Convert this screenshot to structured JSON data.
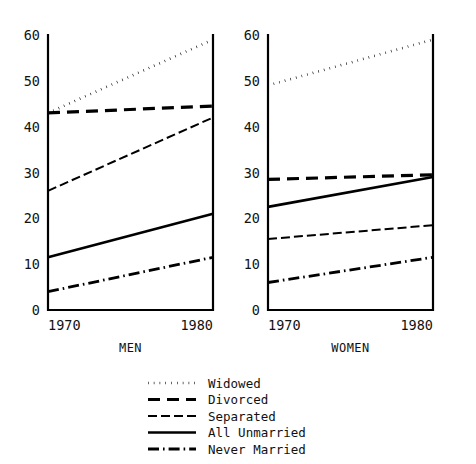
{
  "chart_data": {
    "type": "line",
    "title": "",
    "subtitle": "",
    "xlabel": "",
    "ylabel": "",
    "x": [
      1970,
      1980
    ],
    "xtick_labels": [
      "1970",
      "1980"
    ],
    "ytick_labels": [
      "0",
      "10",
      "20",
      "30",
      "40",
      "50",
      "60"
    ],
    "yticks": [
      0,
      10,
      20,
      30,
      40,
      50,
      60
    ],
    "ylim": [
      0,
      60
    ],
    "xlim": [
      1970,
      1980
    ],
    "grid": false,
    "legend_position": "bottom-center",
    "panels": [
      {
        "label": "MEN",
        "series": [
          {
            "name": "Widowed",
            "style": "dotted",
            "values": [
              43.0,
              59.0
            ]
          },
          {
            "name": "Divorced",
            "style": "dashed",
            "values": [
              43.0,
              44.5
            ]
          },
          {
            "name": "Separated",
            "style": "thin-dash",
            "values": [
              26.0,
              42.0
            ]
          },
          {
            "name": "All Unmarried",
            "style": "solid",
            "values": [
              11.5,
              21.0
            ]
          },
          {
            "name": "Never Married",
            "style": "dash-dot",
            "values": [
              4.0,
              11.5
            ]
          }
        ]
      },
      {
        "label": "WOMEN",
        "series": [
          {
            "name": "Widowed",
            "style": "dotted",
            "values": [
              49.0,
              59.0
            ]
          },
          {
            "name": "Divorced",
            "style": "dashed",
            "values": [
              28.5,
              29.5
            ]
          },
          {
            "name": "Separated",
            "style": "thin-dash",
            "values": [
              15.5,
              18.5
            ]
          },
          {
            "name": "All Unmarried",
            "style": "solid",
            "values": [
              22.5,
              29.0
            ]
          },
          {
            "name": "Never Married",
            "style": "dash-dot",
            "values": [
              6.0,
              11.5
            ]
          }
        ]
      }
    ],
    "legend": [
      {
        "name": "Widowed",
        "style": "dotted"
      },
      {
        "name": "Divorced",
        "style": "dashed"
      },
      {
        "name": "Separated",
        "style": "thin-dash"
      },
      {
        "name": "All Unmarried",
        "style": "solid"
      },
      {
        "name": "Never Married",
        "style": "dash-dot"
      }
    ],
    "colors": {
      "line": "#000000",
      "axis": "#000000",
      "text": "#111111",
      "background": "#ffffff"
    }
  }
}
